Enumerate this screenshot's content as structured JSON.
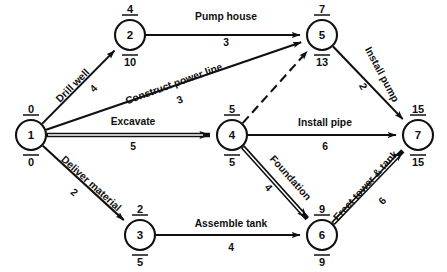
{
  "diagram": {
    "kind": "project-network-diagram",
    "nodes": [
      {
        "id": "1",
        "label": "1",
        "cx": 31,
        "cy": 135,
        "r": 15,
        "early": "0",
        "late": "0"
      },
      {
        "id": "2",
        "label": "2",
        "cx": 130,
        "cy": 35,
        "r": 15,
        "early": "4",
        "late": "10"
      },
      {
        "id": "3",
        "label": "3",
        "cx": 140,
        "cy": 235,
        "r": 15,
        "early": "2",
        "late": "5"
      },
      {
        "id": "4",
        "label": "4",
        "cx": 232,
        "cy": 135,
        "r": 15,
        "early": "5",
        "late": "5"
      },
      {
        "id": "5",
        "label": "5",
        "cx": 322,
        "cy": 35,
        "r": 15,
        "early": "7",
        "late": "13"
      },
      {
        "id": "6",
        "label": "6",
        "cx": 322,
        "cy": 235,
        "r": 15,
        "early": "9",
        "late": "9"
      },
      {
        "id": "7",
        "label": "7",
        "cx": 418,
        "cy": 135,
        "r": 15,
        "early": "15",
        "late": "15"
      }
    ],
    "activities": [
      {
        "id": "drill-well",
        "name": "Drill well",
        "duration": "4",
        "from": "1",
        "to": "2",
        "style": "solid",
        "label_x": 75,
        "label_y": 88,
        "label_rot": -45,
        "dur_x": 96,
        "dur_y": 91,
        "dur_rot": -45
      },
      {
        "id": "construct-power-line",
        "name": "Construct power line",
        "duration": "3",
        "from": "1",
        "to": "5",
        "style": "solid",
        "label_x": 175,
        "label_y": 87,
        "label_rot": -20,
        "dur_x": 181,
        "dur_y": 103,
        "dur_rot": -20
      },
      {
        "id": "excavate",
        "name": "Excavate",
        "duration": "5",
        "from": "1",
        "to": "4",
        "style": "critical",
        "label_x": 133,
        "label_y": 125,
        "label_rot": 0,
        "dur_x": 133,
        "dur_y": 150,
        "dur_rot": 0
      },
      {
        "id": "deliver-material",
        "name": "Deliver material",
        "duration": "2",
        "from": "1",
        "to": "3",
        "style": "solid",
        "label_x": 89,
        "label_y": 186,
        "label_rot": 42,
        "dur_x": 72,
        "dur_y": 195,
        "dur_rot": 42
      },
      {
        "id": "pump-house",
        "name": "Pump house",
        "duration": "3",
        "from": "2",
        "to": "5",
        "style": "solid",
        "label_x": 226,
        "label_y": 20,
        "label_rot": 0,
        "dur_x": 226,
        "dur_y": 46,
        "dur_rot": 0
      },
      {
        "id": "dummy-4-5",
        "name": "",
        "duration": "",
        "from": "4",
        "to": "5",
        "style": "dashed",
        "label_x": 0,
        "label_y": 0,
        "label_rot": 0,
        "dur_x": 0,
        "dur_y": 0,
        "dur_rot": 0
      },
      {
        "id": "install-pipe",
        "name": "Install pipe",
        "duration": "6",
        "from": "4",
        "to": "7",
        "style": "solid",
        "label_x": 325,
        "label_y": 126,
        "label_rot": 0,
        "dur_x": 325,
        "dur_y": 150,
        "dur_rot": 0
      },
      {
        "id": "install-pump",
        "name": "Install pump",
        "duration": "2",
        "from": "5",
        "to": "7",
        "style": "solid",
        "label_x": 379,
        "label_y": 76,
        "label_rot": 62,
        "dur_x": 360,
        "dur_y": 88,
        "dur_rot": 62
      },
      {
        "id": "foundation",
        "name": "Foundation",
        "duration": "4",
        "from": "4",
        "to": "6",
        "style": "critical",
        "label_x": 288,
        "label_y": 180,
        "label_rot": 48,
        "dur_x": 266,
        "dur_y": 190,
        "dur_rot": 48
      },
      {
        "id": "assemble-tank",
        "name": "Assemble tank",
        "duration": "4",
        "from": "3",
        "to": "6",
        "style": "solid",
        "label_x": 231,
        "label_y": 227,
        "label_rot": 0,
        "dur_x": 231,
        "dur_y": 251,
        "dur_rot": 0
      },
      {
        "id": "erect-tower-tank",
        "name": "Erect tower & tank",
        "duration": "6",
        "from": "6",
        "to": "7",
        "style": "critical",
        "label_x": 368,
        "label_y": 188,
        "label_rot": -48,
        "dur_x": 385,
        "dur_y": 203,
        "dur_rot": -48
      }
    ],
    "legend": {
      "node_top_meaning": "earliest event time",
      "node_bottom_meaning": "latest event time"
    },
    "colors": {
      "ink": "#101010",
      "background": "#ffffff"
    }
  }
}
